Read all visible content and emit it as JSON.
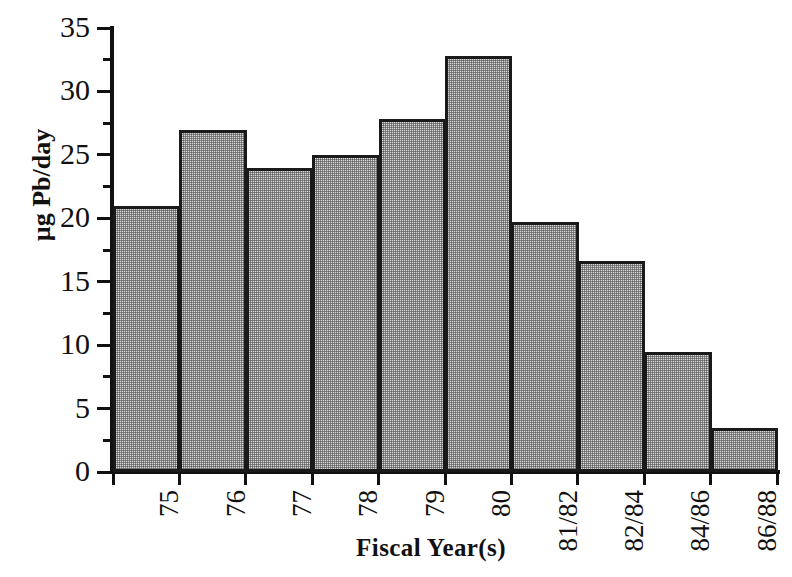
{
  "chart_data": {
    "type": "bar",
    "title": "",
    "xlabel": "Fiscal Year(s)",
    "ylabel": "µg Pb/day",
    "categories": [
      "75",
      "76",
      "77",
      "78",
      "79",
      "80",
      "81/82",
      "82/84",
      "84/86",
      "86/88"
    ],
    "values": [
      21.0,
      27.0,
      24.0,
      25.0,
      27.8,
      32.8,
      19.7,
      16.6,
      9.5,
      3.5
    ],
    "ylim": [
      0,
      35
    ],
    "ytick_major": [
      0,
      5,
      10,
      15,
      20,
      25,
      30,
      35
    ],
    "ytick_major_labels": [
      "0",
      "5",
      "10",
      "15",
      "20",
      "25",
      "30",
      "35"
    ],
    "ytick_minor": [
      2.5,
      7.5,
      12.5,
      17.5,
      22.5,
      27.5,
      32.5
    ],
    "grid": false,
    "legend": null,
    "bar_fill": "#d9d9d9",
    "bar_edge": "#1a1a1a",
    "background": "#ffffff",
    "xtick_rotation": -90
  }
}
